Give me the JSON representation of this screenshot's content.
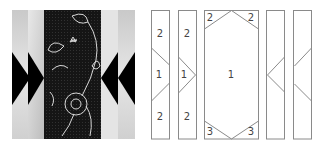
{
  "photo": {
    "description": "quilted fabric panel with black triangles and embroidered dark center band",
    "colors": {
      "light_fabric": "#d8d8d8",
      "dark_band": "#1a1a1a",
      "triangle": "#000000",
      "embroidery": "#cfcfcf"
    }
  },
  "diagram": {
    "stroke_color": "#8a8a8a",
    "label_color": "#444444",
    "pieces": [
      {
        "id": "strip-1",
        "labels": [
          "2",
          "1",
          "2"
        ]
      },
      {
        "id": "strip-2",
        "labels": [
          "2",
          "1",
          "2"
        ]
      },
      {
        "id": "center-panel",
        "labels": [
          "2",
          "2",
          "1",
          "3",
          "3"
        ]
      },
      {
        "id": "strip-4",
        "labels": []
      },
      {
        "id": "strip-5",
        "labels": []
      }
    ]
  }
}
